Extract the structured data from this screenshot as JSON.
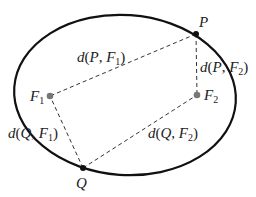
{
  "diagram": {
    "colors": {
      "ellipse": "#111111",
      "dashed": "#333333",
      "point": "#111111",
      "focus": "#777777",
      "text": "#222222"
    },
    "ellipse": {
      "cx": 125,
      "cy": 95,
      "rx": 111,
      "ry": 80,
      "rotation_deg": 4
    },
    "points": {
      "P": {
        "label": "P",
        "x": 196,
        "y": 34
      },
      "Q": {
        "label": "Q",
        "x": 83,
        "y": 168
      },
      "F1": {
        "label": "F",
        "sub": "1",
        "x": 50,
        "y": 96
      },
      "F2": {
        "label": "F",
        "sub": "2",
        "x": 197,
        "y": 95
      }
    },
    "distance_labels": {
      "pf1": {
        "d": "d",
        "open": "(",
        "a": "P",
        "comma": ", ",
        "b": "F",
        "b_sub": "1",
        "close": ")"
      },
      "pf2": {
        "d": "d",
        "open": "(",
        "a": "P",
        "comma": ", ",
        "b": "F",
        "b_sub": "2",
        "close": ")"
      },
      "qf1": {
        "d": "d",
        "open": "(",
        "a": "Q",
        "comma": ", ",
        "b": "F",
        "b_sub": "1",
        "close": ")"
      },
      "qf2": {
        "d": "d",
        "open": "(",
        "a": "Q",
        "comma": ", ",
        "b": "F",
        "b_sub": "2",
        "close": ")"
      }
    }
  }
}
